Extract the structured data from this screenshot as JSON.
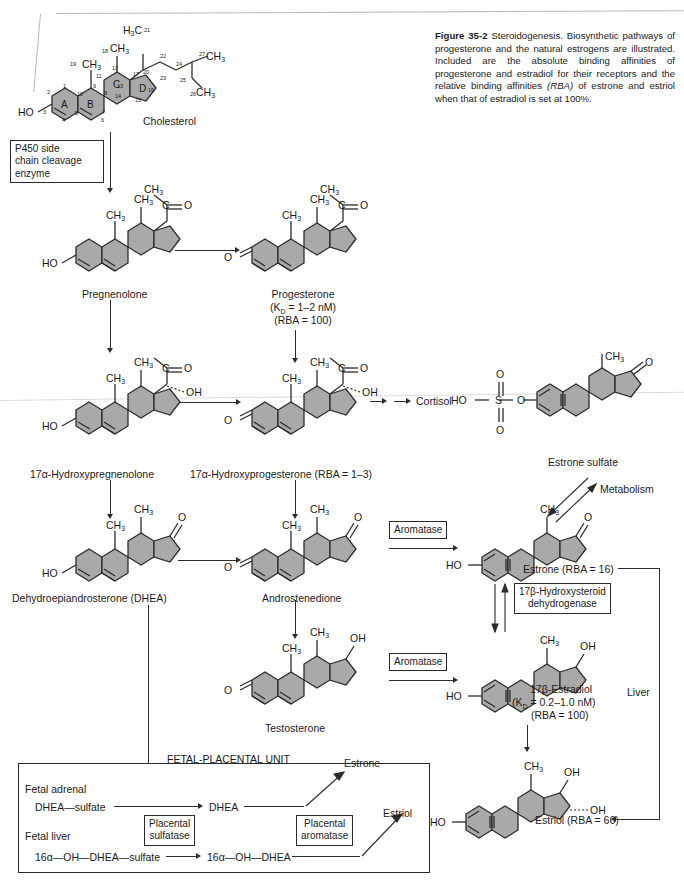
{
  "figure": {
    "number": "Figure 35-2",
    "title": "Steroidogenesis.",
    "caption": "Biosynthetic pathways of progesterone and the natural estrogens are illustrated. Included are the absolute binding affinities of progesterone and estradiol for their receptors and the relative binding affinities",
    "caption_italic": "(RBA)",
    "caption_tail": "of estrone and estriol when that of estradiol is set at 100%."
  },
  "colors": {
    "ring_fill": "#a9a9a9",
    "ring_stroke": "#2b2b2b",
    "text": "#1a1a1a",
    "page_bg": "#ffffff"
  },
  "molecules": {
    "cholesterol": {
      "name": "Cholesterol",
      "hydroxyl": "HO",
      "ring_letters": [
        "A",
        "B",
        "C",
        "D"
      ],
      "methyl_18": "CH",
      "methyl_18_sub": "3",
      "methyl_19": "CH",
      "methyl_19_sub": "3",
      "sidechain_21": "H",
      "sidechain_21_sub": "3",
      "sidechain_21_c": "C",
      "sidechain_26": "CH",
      "sidechain_26_sub": "3",
      "sidechain_27": "CH",
      "sidechain_27_sub": "3",
      "carbon_numbers": [
        "1",
        "2",
        "3",
        "4",
        "5",
        "6",
        "7",
        "8",
        "9",
        "10",
        "11",
        "12",
        "13",
        "14",
        "15",
        "16",
        "17",
        "18",
        "19",
        "20",
        "21",
        "22",
        "23",
        "24",
        "25",
        "26",
        "27"
      ]
    },
    "pregnenolone": {
      "name": "Pregnenolone",
      "hydroxyl": "HO",
      "acetyl_ch3": "CH",
      "acetyl_sub": "3",
      "carbonyl_c": "C",
      "carbonyl_o": "O",
      "methyl": "CH",
      "methyl_sub": "3"
    },
    "progesterone": {
      "name": "Progesterone",
      "kd": "(K",
      "kd_sub": "D",
      "kd_val": " = 1–2  nM)",
      "rba": "(RBA = 100)",
      "ketone_o": "O"
    },
    "hydroxypregnenolone": {
      "name": "17α-Hydroxypregnenolone",
      "hydroxyl": "HO",
      "oh": "OH"
    },
    "hydroxyprogesterone": {
      "name": "17α-Hydroxyprogesterone (RBA = 1–3)",
      "oh": "OH",
      "ketone_o": "O"
    },
    "cortisol": {
      "name": "Cortisol"
    },
    "estrone_sulfate": {
      "name": "Estrone sulfate",
      "ho": "HO",
      "sulfur": "S",
      "oxygen": "O",
      "ester_o": "O",
      "methyl": "CH",
      "methyl_sub": "3",
      "ketone_o": "O"
    },
    "dhea": {
      "name": "Dehydroepiandrosterone (DHEA)",
      "hydroxyl": "HO",
      "methyl": "CH",
      "methyl_sub": "3",
      "ketone_o": "O"
    },
    "androstenedione": {
      "name": "Androstenedione",
      "ketone_o": "O",
      "methyl": "CH",
      "methyl_sub": "3"
    },
    "estrone": {
      "name": "Estrone (RBA = 16)",
      "hydroxyl": "HO",
      "methyl": "CH",
      "methyl_sub": "3",
      "ketone_o": "O"
    },
    "testosterone": {
      "name": "Testosterone",
      "ketone_o": "O",
      "methyl": "CH",
      "methyl_sub": "3",
      "oh": "OH"
    },
    "estradiol": {
      "name": "17β-Estradiol",
      "kd": "(K",
      "kd_sub": "D",
      "kd_val": " = 0.2–1.0 nM)",
      "rba": "(RBA = 100)",
      "hydroxyl": "HO",
      "methyl": "CH",
      "methyl_sub": "3",
      "oh": "OH"
    },
    "estriol": {
      "name": "Estriol (RBA = 66)",
      "hydroxyl": "HO",
      "methyl": "CH",
      "methyl_sub": "3",
      "oh_17": "OH",
      "oh_16": "OH"
    }
  },
  "enzymes": {
    "p450_scc": "P450 side\nchain cleavage\nenzyme",
    "p450_scc_lines": [
      "P450 side",
      "chain cleavage",
      "enzyme"
    ],
    "aromatase_1": "Aromatase",
    "aromatase_2": "Aromatase",
    "hsd_17b_lines": [
      "17β-Hydroxysteroid",
      "dehydrogenase"
    ],
    "placental_sulfatase_lines": [
      "Placental",
      "sulfatase"
    ],
    "placental_aromatase_lines": [
      "Placental",
      "aromatase"
    ]
  },
  "annotations": {
    "metabolism": "Metabolism",
    "liver": "Liver"
  },
  "fetal_placental_unit": {
    "title": "FETAL-PLACENTAL UNIT",
    "fetal_adrenal": "Fetal adrenal",
    "fetal_liver": "Fetal  liver",
    "dhea_sulfate": "DHEA—sulfate",
    "dhea": "DHEA",
    "hydroxy_dhea_sulfate": "16α—OH—DHEA—sulfate",
    "hydroxy_dhea": "16α—OH—DHEA",
    "estrone_out": "Estrone",
    "estriol_out": "Estriol"
  }
}
